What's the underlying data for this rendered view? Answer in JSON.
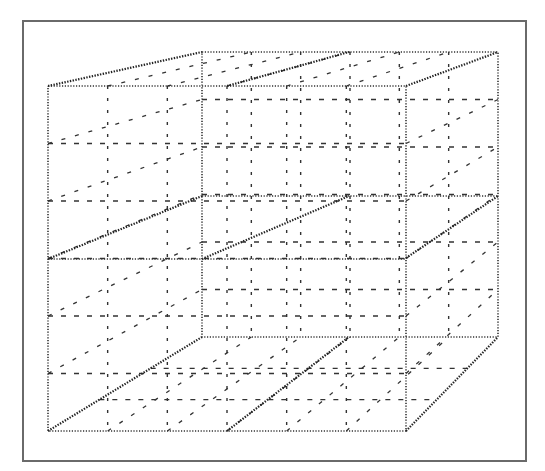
{
  "diagram": {
    "title": "",
    "colors": {
      "frame": "#6a6a6a",
      "lines": "#333333",
      "background": "#ffffff"
    },
    "faces": [
      "front",
      "back",
      "left-wall",
      "right-wall",
      "top",
      "floor"
    ],
    "grid_divisions": {
      "vertical": 6,
      "horizontal": 6
    },
    "labels": []
  }
}
